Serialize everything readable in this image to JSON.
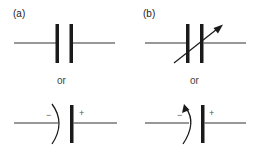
{
  "panels": [
    {
      "label": "(a)",
      "description": "Fixed capacitor",
      "alternative_label": "or",
      "alternative_description": "Polarized (electrolytic) capacitor",
      "polarity": {
        "negative": "−",
        "positive": "+"
      }
    },
    {
      "label": "(b)",
      "description": "Variable capacitor",
      "alternative_label": "or",
      "alternative_description": "Variable polarized capacitor",
      "polarity": {
        "negative": "−",
        "positive": "+"
      }
    }
  ],
  "colors": {
    "stroke": "#1a1a1a",
    "lead": "#333333",
    "text": "#222222"
  }
}
